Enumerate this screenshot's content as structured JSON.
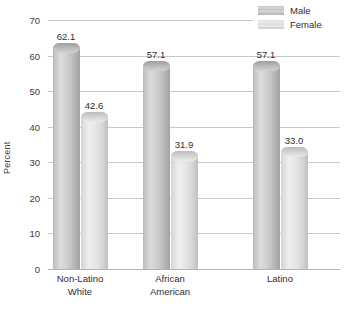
{
  "chart_data": {
    "type": "bar",
    "title": "",
    "subtitle": "",
    "xlabel": "",
    "ylabel": "Percent",
    "ylim": [
      0,
      70
    ],
    "ytick_step": 10,
    "yticks": [
      0,
      10,
      20,
      30,
      40,
      50,
      60,
      70
    ],
    "ytick_labels": [
      "0",
      "10",
      "20",
      "30",
      "40",
      "50",
      "60",
      "70"
    ],
    "grid": true,
    "grid_axis": "y",
    "legend_position": "top-right",
    "categories": [
      "Non-Latino White",
      "African American",
      "Latino"
    ],
    "category_lines": [
      [
        "Non-Latino",
        "White"
      ],
      [
        "African",
        "American"
      ],
      [
        "Latino",
        ""
      ]
    ],
    "series": [
      {
        "name": "Male",
        "color": "#c4c4c4",
        "values": [
          62.1,
          57.1,
          57.1
        ],
        "labels": [
          "62.1",
          "57.1",
          "57.1"
        ]
      },
      {
        "name": "Female",
        "color": "#e2e2e2",
        "values": [
          42.6,
          31.9,
          33.0
        ],
        "labels": [
          "42.6",
          "31.9",
          "33.0"
        ]
      }
    ],
    "annotations": []
  },
  "legend": {
    "entries": [
      {
        "label": "Male",
        "swatch": "male-swatch"
      },
      {
        "label": "Female",
        "swatch": "female-swatch"
      }
    ]
  }
}
